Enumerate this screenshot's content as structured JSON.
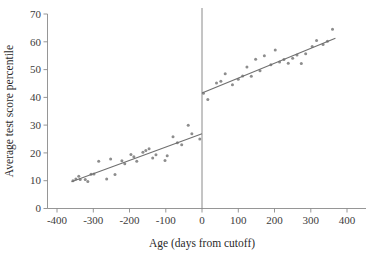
{
  "chart_data": {
    "type": "scatter",
    "title": "",
    "xlabel": "Age (days from cutoff)",
    "ylabel": "Average test score percentile",
    "xlim": [
      -400,
      400
    ],
    "ylim": [
      0,
      70
    ],
    "xticks": [
      -400,
      -300,
      -200,
      -100,
      0,
      100,
      200,
      300,
      400
    ],
    "xticklabels": [
      "-400",
      "-300",
      "-200",
      "-100",
      "0",
      "100",
      "200",
      "300",
      "400"
    ],
    "yticks": [
      0,
      10,
      20,
      30,
      40,
      50,
      60,
      70
    ],
    "yticklabels": [
      "0",
      "10",
      "20",
      "30",
      "40",
      "50",
      "60",
      "70"
    ],
    "grid": false,
    "legend": null,
    "marker_color": "#8d8d8d",
    "line_color": "#6f6f6f",
    "cutoff_x": 0,
    "annotations": [
      {
        "name": "cutoff-line",
        "x": 0,
        "label": ""
      }
    ],
    "series": [
      {
        "name": "left-of-cutoff-points",
        "type": "scatter",
        "points": [
          {
            "x": -356,
            "y": 10.0
          },
          {
            "x": -348,
            "y": 10.6
          },
          {
            "x": -340,
            "y": 11.6
          },
          {
            "x": -336,
            "y": 10.4
          },
          {
            "x": -322,
            "y": 10.4
          },
          {
            "x": -315,
            "y": 9.7
          },
          {
            "x": -306,
            "y": 12.3
          },
          {
            "x": -298,
            "y": 12.4
          },
          {
            "x": -285,
            "y": 17.0
          },
          {
            "x": -263,
            "y": 10.6
          },
          {
            "x": -252,
            "y": 17.8
          },
          {
            "x": -240,
            "y": 12.2
          },
          {
            "x": -221,
            "y": 17.2
          },
          {
            "x": -213,
            "y": 16.1
          },
          {
            "x": -196,
            "y": 19.4
          },
          {
            "x": -188,
            "y": 18.6
          },
          {
            "x": -180,
            "y": 17.0
          },
          {
            "x": -163,
            "y": 20.2
          },
          {
            "x": -155,
            "y": 20.9
          },
          {
            "x": -146,
            "y": 21.5
          },
          {
            "x": -136,
            "y": 18.2
          },
          {
            "x": -127,
            "y": 19.3
          },
          {
            "x": -102,
            "y": 17.3
          },
          {
            "x": -96,
            "y": 19.0
          },
          {
            "x": -80,
            "y": 25.8
          },
          {
            "x": -68,
            "y": 23.7
          },
          {
            "x": -56,
            "y": 22.9
          },
          {
            "x": -38,
            "y": 30.0
          },
          {
            "x": -28,
            "y": 26.9
          },
          {
            "x": -6,
            "y": 25.0
          }
        ]
      },
      {
        "name": "right-of-cutoff-points",
        "type": "scatter",
        "points": [
          {
            "x": 4,
            "y": 41.5
          },
          {
            "x": 16,
            "y": 39.2
          },
          {
            "x": 40,
            "y": 45.2
          },
          {
            "x": 52,
            "y": 45.8
          },
          {
            "x": 64,
            "y": 48.5
          },
          {
            "x": 84,
            "y": 44.5
          },
          {
            "x": 100,
            "y": 46.5
          },
          {
            "x": 112,
            "y": 47.7
          },
          {
            "x": 124,
            "y": 50.9
          },
          {
            "x": 136,
            "y": 47.6
          },
          {
            "x": 148,
            "y": 53.7
          },
          {
            "x": 160,
            "y": 49.6
          },
          {
            "x": 172,
            "y": 55.0
          },
          {
            "x": 190,
            "y": 51.7
          },
          {
            "x": 202,
            "y": 57.0
          },
          {
            "x": 214,
            "y": 52.7
          },
          {
            "x": 226,
            "y": 53.6
          },
          {
            "x": 238,
            "y": 52.3
          },
          {
            "x": 250,
            "y": 54.1
          },
          {
            "x": 262,
            "y": 55.2
          },
          {
            "x": 274,
            "y": 52.2
          },
          {
            "x": 286,
            "y": 55.7
          },
          {
            "x": 304,
            "y": 58.3
          },
          {
            "x": 316,
            "y": 60.5
          },
          {
            "x": 334,
            "y": 59.0
          },
          {
            "x": 346,
            "y": 60.2
          },
          {
            "x": 360,
            "y": 64.5
          }
        ]
      },
      {
        "name": "left-fit-line",
        "type": "line",
        "points": [
          {
            "x": -360,
            "y": 9.6
          },
          {
            "x": 0,
            "y": 26.9
          }
        ]
      },
      {
        "name": "right-fit-line",
        "type": "line",
        "points": [
          {
            "x": 0,
            "y": 41.6
          },
          {
            "x": 368,
            "y": 61.3
          }
        ]
      }
    ]
  }
}
